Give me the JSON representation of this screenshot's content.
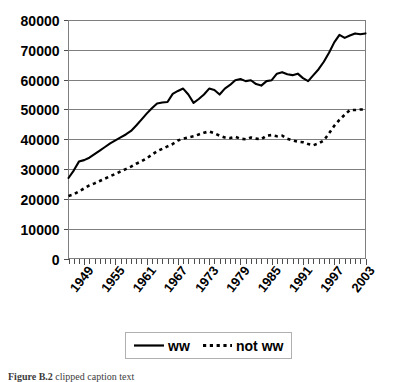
{
  "figure": {
    "caption_prefix": "Figure B.2",
    "caption_rest": " clipped caption text"
  },
  "legend": {
    "position": "bottom",
    "entries": [
      {
        "label": "ww",
        "style": "solid"
      },
      {
        "label": "not ww",
        "style": "dashed"
      }
    ]
  },
  "axes": {
    "y_ticks": [
      "0",
      "10000",
      "20000",
      "30000",
      "40000",
      "50000",
      "60000",
      "70000",
      "80000"
    ],
    "x_ticks": [
      "1949",
      "1955",
      "1961",
      "1967",
      "1973",
      "1979",
      "1985",
      "1991",
      "1997",
      "2003"
    ]
  },
  "chart_data": {
    "type": "line",
    "title": "",
    "xlabel": "",
    "ylabel": "",
    "ylim": [
      0,
      80000
    ],
    "xlim": [
      1946,
      2003
    ],
    "grid": true,
    "legend_position": "bottom",
    "x": [
      1946,
      1947,
      1948,
      1949,
      1950,
      1951,
      1952,
      1953,
      1954,
      1955,
      1956,
      1957,
      1958,
      1959,
      1960,
      1961,
      1962,
      1963,
      1964,
      1965,
      1966,
      1967,
      1968,
      1969,
      1970,
      1971,
      1972,
      1973,
      1974,
      1975,
      1976,
      1977,
      1978,
      1979,
      1980,
      1981,
      1982,
      1983,
      1984,
      1985,
      1986,
      1987,
      1988,
      1989,
      1990,
      1991,
      1992,
      1993,
      1994,
      1995,
      1996,
      1997,
      1998,
      1999,
      2000,
      2001,
      2002,
      2003
    ],
    "tick_labels_x": [
      "1949",
      "1955",
      "1961",
      "1967",
      "1973",
      "1979",
      "1985",
      "1991",
      "1997",
      "2003"
    ],
    "tick_values_x": [
      1949,
      1955,
      1961,
      1967,
      1973,
      1979,
      1985,
      1991,
      1997,
      2003
    ],
    "tick_values_y": [
      0,
      10000,
      20000,
      30000,
      40000,
      50000,
      60000,
      70000,
      80000
    ],
    "series": [
      {
        "name": "ww",
        "style": "solid",
        "color": "#000000",
        "values": [
          27000,
          29500,
          32500,
          33000,
          33800,
          35000,
          36200,
          37400,
          38600,
          39600,
          40600,
          41600,
          42800,
          44600,
          46600,
          48600,
          50400,
          52000,
          52300,
          52500,
          55200,
          56200,
          57000,
          55000,
          52200,
          53500,
          55000,
          57000,
          56500,
          55000,
          57000,
          58200,
          59800,
          60200,
          59500,
          59800,
          58500,
          58000,
          59500,
          59800,
          62000,
          62500,
          61800,
          61500,
          62000,
          60500,
          59500,
          61500,
          63500,
          66000,
          69000,
          72500,
          75000,
          74000,
          74800,
          75500,
          75200,
          75500
        ]
      },
      {
        "name": "not ww",
        "style": "dashed",
        "color": "#000000",
        "values": [
          21000,
          21500,
          22500,
          23500,
          24500,
          25200,
          26000,
          26800,
          27600,
          28400,
          29200,
          30000,
          30800,
          31800,
          32600,
          33600,
          34800,
          36000,
          36800,
          37600,
          38400,
          39600,
          40200,
          40600,
          41000,
          41600,
          42200,
          42600,
          42000,
          41200,
          40600,
          40400,
          40800,
          40200,
          40000,
          40600,
          40200,
          40000,
          41200,
          41400,
          41000,
          41200,
          40200,
          39600,
          39200,
          39000,
          38400,
          38000,
          38600,
          39600,
          42000,
          44500,
          46500,
          48200,
          49800,
          49800,
          50000,
          50000
        ]
      }
    ]
  }
}
